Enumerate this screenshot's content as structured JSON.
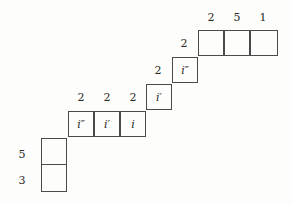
{
  "diagram": {
    "type": "skew-tableau",
    "top_row": {
      "labels": [
        "2",
        "5",
        "1"
      ],
      "cells": [
        "",
        "",
        ""
      ]
    },
    "step_labels": [
      "2",
      "2"
    ],
    "step_cells": [
      "i″",
      "i′"
    ],
    "middle_row": {
      "labels": [
        "2",
        "2",
        "2"
      ],
      "cells": [
        "i″",
        "i′",
        "i"
      ]
    },
    "left_column": {
      "labels": [
        "5",
        "3"
      ],
      "cells": [
        "",
        ""
      ]
    }
  }
}
